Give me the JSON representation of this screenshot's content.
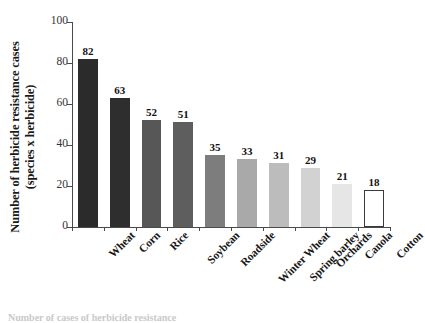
{
  "chart_data": {
    "type": "bar",
    "title": "",
    "xlabel": "",
    "ylabel": "Number of herbicide resistance cases (species x herbicide)",
    "ylabel_line1": "Number of herbicide resistance cases",
    "ylabel_line2": "(species x herbicide)",
    "categories": [
      "Wheat",
      "Corn",
      "Rice",
      "Soybean",
      "Roadside",
      "Winter Wheat",
      "Spring barley",
      "Orchards",
      "Canola",
      "Cotton"
    ],
    "values": [
      82,
      63,
      52,
      51,
      35,
      33,
      31,
      29,
      21,
      18
    ],
    "bar_colors": [
      "#2b2b2b",
      "#2e2e2e",
      "#575757",
      "#5e5e5e",
      "#7d7d7d",
      "#a9a9a9",
      "#bcbcbc",
      "#d2d2d2",
      "#e6e6e6",
      "#ffffff"
    ],
    "bar_border_color": "#3a3a3a",
    "ylim": [
      0,
      100
    ],
    "yticks": [
      0,
      20,
      40,
      60,
      80,
      100
    ],
    "ytick_labels": [
      "0",
      "20",
      "40",
      "60",
      "80",
      "100"
    ],
    "grid": false,
    "legend": false,
    "value_labels_shown": true,
    "axis_color": "#4a4a4a"
  },
  "caption": {
    "clipped_text": "Number of cases of herbicide resistance"
  }
}
